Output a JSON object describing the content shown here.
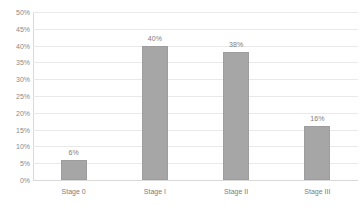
{
  "chart_data": {
    "type": "bar",
    "title": "",
    "xlabel": "",
    "ylabel": "",
    "categories": [
      "Stage 0",
      "Stage I",
      "Stage II",
      "Stage III"
    ],
    "values": [
      6,
      40,
      38,
      16
    ],
    "value_labels": [
      "6%",
      "40%",
      "38%",
      "16%"
    ],
    "ylim": [
      0,
      50
    ],
    "ytick_labels": [
      "50%",
      "45%",
      "40%",
      "35%",
      "30%",
      "25%",
      "20%",
      "15%",
      "10%",
      "5%",
      "0%"
    ],
    "ytick_values": [
      50,
      45,
      40,
      35,
      30,
      25,
      20,
      15,
      10,
      5,
      0
    ],
    "grid": true,
    "legend": false,
    "bar_color": "#A6A6A6",
    "grid_color": "#E9E9E9",
    "text_color": "#7D7D7D",
    "background": "#FFFFFF"
  },
  "title_remnant": ""
}
